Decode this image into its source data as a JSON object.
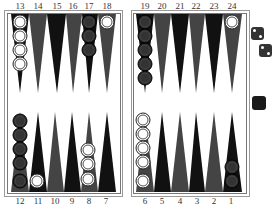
{
  "board": {
    "colors": {
      "board_bg": "#ffffff",
      "frame": "#777777",
      "point_dark": "#111111",
      "point_gray": "#444444",
      "white_checker": "#ffffff",
      "dark_checker": "#2a2a2a"
    },
    "top_numbers": [
      "13",
      "14",
      "15",
      "16",
      "17",
      "18",
      "19",
      "20",
      "21",
      "22",
      "23",
      "24"
    ],
    "bottom_numbers": [
      "12",
      "11",
      "10",
      "9",
      "8",
      "7",
      "6",
      "5",
      "4",
      "3",
      "2",
      "1"
    ],
    "positions": [
      {
        "point": 13,
        "color": "white",
        "count": 4
      },
      {
        "point": 17,
        "color": "dark",
        "count": 3
      },
      {
        "point": 18,
        "color": "white",
        "count": 1
      },
      {
        "point": 19,
        "color": "dark",
        "count": 5
      },
      {
        "point": 24,
        "color": "white",
        "count": 1
      },
      {
        "point": 12,
        "color": "dark",
        "count": 5
      },
      {
        "point": 11,
        "color": "white",
        "count": 1
      },
      {
        "point": 8,
        "color": "white",
        "count": 3
      },
      {
        "point": 6,
        "color": "white",
        "count": 5
      },
      {
        "point": 1,
        "color": "dark",
        "count": 2
      }
    ]
  },
  "dice": [
    {
      "value": 2,
      "icon": "die-icon"
    },
    {
      "value": 2,
      "icon": "die-icon"
    }
  ],
  "cube": {
    "icon": "doubling-cube-icon",
    "value": ""
  }
}
